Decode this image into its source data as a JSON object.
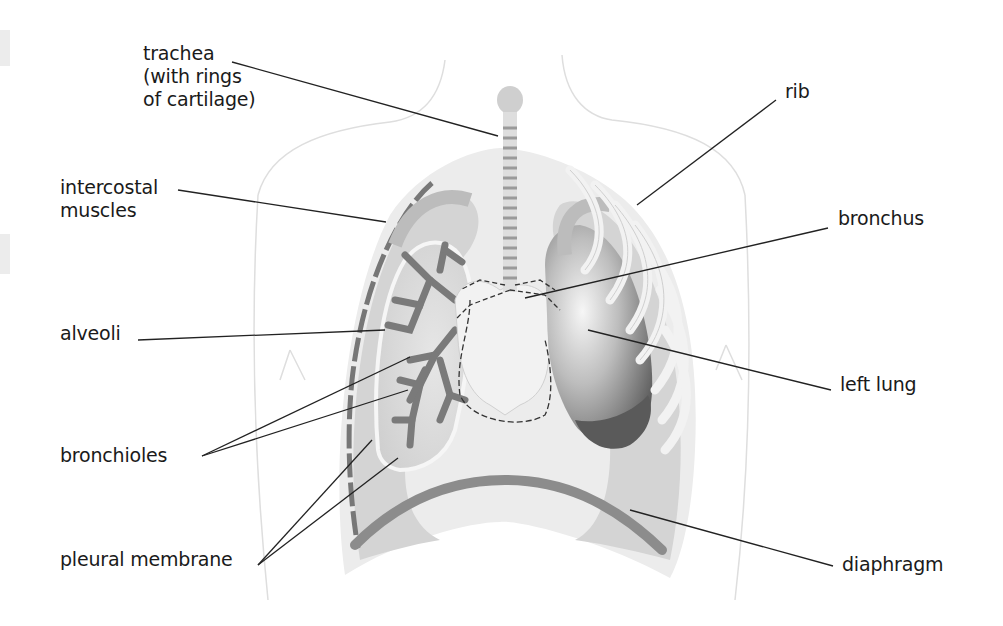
{
  "diagram": {
    "colors": {
      "background": "#ffffff",
      "body_outline": "#dcdcdc",
      "pleural_fill": "#d4d4d4",
      "cavity_fill": "#e8e8e8",
      "lung_dark": "#6e6e6e",
      "lung_light": "#f4f4f4",
      "bronchiole_tree": "#7a7a7a",
      "rib": "#f2f2f2",
      "diaphragm": "#8c8c8c",
      "leader_line": "#222222",
      "label_text": "#1a1a1a"
    },
    "labels": {
      "trachea": "trachea\n(with rings\nof cartilage)",
      "intercostal": "intercostal\nmuscles",
      "alveoli": "alveoli",
      "bronchioles": "bronchioles",
      "pleural": "pleural membrane",
      "rib": "rib",
      "bronchus": "bronchus",
      "left_lung": "left lung",
      "diaphragm": "diaphragm"
    }
  }
}
